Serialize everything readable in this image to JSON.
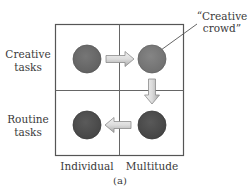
{
  "figure": {
    "caption": "(a)",
    "rows": [
      {
        "line1": "Creative",
        "line2": "tasks"
      },
      {
        "line1": "Routine",
        "line2": "tasks"
      }
    ],
    "columns": [
      {
        "label": "Individual"
      },
      {
        "label": "Multitude"
      }
    ],
    "callout": {
      "line1": "“Creative",
      "line2": "crowd”"
    },
    "cells": [
      {
        "row": "Creative tasks",
        "column": "Individual",
        "node_color": "#6a6a6a"
      },
      {
        "row": "Creative tasks",
        "column": "Multitude",
        "node_color": "#7a7a7a",
        "annotated": "Creative crowd"
      },
      {
        "row": "Routine tasks",
        "column": "Individual",
        "node_color": "#4c4c4c"
      },
      {
        "row": "Routine tasks",
        "column": "Multitude",
        "node_color": "#4a4a4a"
      }
    ],
    "arrows": [
      {
        "from": "Creative tasks / Individual",
        "to": "Creative tasks / Multitude",
        "direction": "right"
      },
      {
        "from": "Creative tasks / Multitude",
        "to": "Routine tasks / Multitude",
        "direction": "down"
      },
      {
        "from": "Routine tasks / Multitude",
        "to": "Routine tasks / Individual",
        "direction": "left"
      }
    ],
    "colors": {
      "grid_line": "#555555",
      "arrow_fill_light": "#e6e6e6",
      "arrow_fill_dark": "#b5b5b5",
      "arrow_stroke": "#8a8a8a",
      "leader_line": "#555555"
    }
  }
}
